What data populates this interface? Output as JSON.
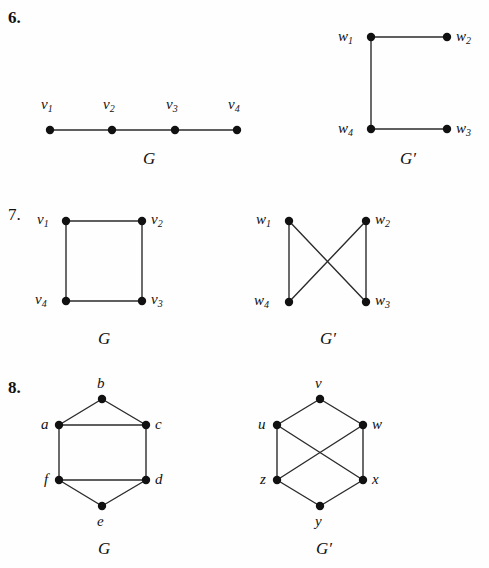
{
  "page": {
    "width": 489,
    "height": 568,
    "background": "#fefefe",
    "ink": "#1a1a1a",
    "kind": "textbook-exercise-figures"
  },
  "problems": [
    {
      "number": "6.",
      "number_style": "bold",
      "graphs": [
        {
          "name": "G",
          "name_x": 143,
          "name_y": 150,
          "vertices": [
            {
              "id": "v1",
              "label": "v",
              "sub": "1",
              "x": 50,
              "y": 130,
              "label_x": 41,
              "label_y": 97
            },
            {
              "id": "v2",
              "label": "v",
              "sub": "2",
              "x": 112,
              "y": 130,
              "label_x": 103,
              "label_y": 97
            },
            {
              "id": "v3",
              "label": "v",
              "sub": "3",
              "x": 175,
              "y": 130,
              "label_x": 166,
              "label_y": 97
            },
            {
              "id": "v4",
              "label": "v",
              "sub": "4",
              "x": 237,
              "y": 130,
              "label_x": 228,
              "label_y": 97
            }
          ],
          "edges": [
            [
              "v1",
              "v2"
            ],
            [
              "v2",
              "v3"
            ],
            [
              "v3",
              "v4"
            ]
          ]
        },
        {
          "name": "G′",
          "name_x": 400,
          "name_y": 150,
          "vertices": [
            {
              "id": "w1",
              "label": "w",
              "sub": "1",
              "x": 371,
              "y": 37,
              "label_x": 338,
              "label_y": 29
            },
            {
              "id": "w2",
              "label": "w",
              "sub": "2",
              "x": 447,
              "y": 37,
              "label_x": 456,
              "label_y": 29
            },
            {
              "id": "w3",
              "label": "w",
              "sub": "3",
              "x": 447,
              "y": 129,
              "label_x": 456,
              "label_y": 121
            },
            {
              "id": "w4",
              "label": "w",
              "sub": "4",
              "x": 371,
              "y": 129,
              "label_x": 338,
              "label_y": 121
            }
          ],
          "edges": [
            [
              "w1",
              "w2"
            ],
            [
              "w1",
              "w4"
            ],
            [
              "w4",
              "w3"
            ]
          ]
        }
      ]
    },
    {
      "number": "7.",
      "number_style": "regular",
      "graphs": [
        {
          "name": "G",
          "name_x": 98,
          "name_y": 330,
          "vertices": [
            {
              "id": "v1",
              "label": "v",
              "sub": "1",
              "x": 66,
              "y": 221,
              "label_x": 37,
              "label_y": 212
            },
            {
              "id": "v2",
              "label": "v",
              "sub": "2",
              "x": 142,
              "y": 221,
              "label_x": 151,
              "label_y": 212
            },
            {
              "id": "v3",
              "label": "v",
              "sub": "3",
              "x": 142,
              "y": 301,
              "label_x": 151,
              "label_y": 292
            },
            {
              "id": "v4",
              "label": "v",
              "sub": "4",
              "x": 66,
              "y": 301,
              "label_x": 35,
              "label_y": 292
            }
          ],
          "edges": [
            [
              "v1",
              "v2"
            ],
            [
              "v2",
              "v3"
            ],
            [
              "v3",
              "v4"
            ],
            [
              "v4",
              "v1"
            ]
          ]
        },
        {
          "name": "G′",
          "name_x": 320,
          "name_y": 330,
          "vertices": [
            {
              "id": "w1",
              "label": "w",
              "sub": "1",
              "x": 289,
              "y": 221,
              "label_x": 256,
              "label_y": 212
            },
            {
              "id": "w2",
              "label": "w",
              "sub": "2",
              "x": 366,
              "y": 221,
              "label_x": 375,
              "label_y": 212
            },
            {
              "id": "w3",
              "label": "w",
              "sub": "3",
              "x": 366,
              "y": 302,
              "label_x": 375,
              "label_y": 293
            },
            {
              "id": "w4",
              "label": "w",
              "sub": "4",
              "x": 289,
              "y": 302,
              "label_x": 254,
              "label_y": 293
            }
          ],
          "edges": [
            [
              "w1",
              "w4"
            ],
            [
              "w2",
              "w3"
            ],
            [
              "w1",
              "w3"
            ],
            [
              "w2",
              "w4"
            ]
          ]
        }
      ]
    },
    {
      "number": "8.",
      "number_style": "bold",
      "graphs": [
        {
          "name": "G",
          "name_x": 98,
          "name_y": 540,
          "vertices": [
            {
              "id": "b",
              "label": "b",
              "sub": "",
              "x": 102,
              "y": 399,
              "label_x": 97,
              "label_y": 376
            },
            {
              "id": "a",
              "label": "a",
              "sub": "",
              "x": 59,
              "y": 425,
              "label_x": 41,
              "label_y": 417
            },
            {
              "id": "c",
              "label": "c",
              "sub": "",
              "x": 146,
              "y": 425,
              "label_x": 155,
              "label_y": 417
            },
            {
              "id": "f",
              "label": "f",
              "sub": "",
              "x": 59,
              "y": 480,
              "label_x": 44,
              "label_y": 472
            },
            {
              "id": "d",
              "label": "d",
              "sub": "",
              "x": 146,
              "y": 480,
              "label_x": 155,
              "label_y": 472
            },
            {
              "id": "e",
              "label": "e",
              "sub": "",
              "x": 102,
              "y": 506,
              "label_x": 97,
              "label_y": 514
            }
          ],
          "edges": [
            [
              "a",
              "b"
            ],
            [
              "b",
              "c"
            ],
            [
              "a",
              "c"
            ],
            [
              "a",
              "f"
            ],
            [
              "c",
              "d"
            ],
            [
              "f",
              "d"
            ],
            [
              "f",
              "e"
            ],
            [
              "e",
              "d"
            ]
          ]
        },
        {
          "name": "G′",
          "name_x": 316,
          "name_y": 540,
          "vertices": [
            {
              "id": "v",
              "label": "v",
              "sub": "",
              "x": 320,
              "y": 399,
              "label_x": 315,
              "label_y": 376
            },
            {
              "id": "u",
              "label": "u",
              "sub": "",
              "x": 277,
              "y": 425,
              "label_x": 258,
              "label_y": 417
            },
            {
              "id": "w",
              "label": "w",
              "sub": "",
              "x": 363,
              "y": 425,
              "label_x": 372,
              "label_y": 417
            },
            {
              "id": "z",
              "label": "z",
              "sub": "",
              "x": 277,
              "y": 480,
              "label_x": 260,
              "label_y": 472
            },
            {
              "id": "x",
              "label": "x",
              "sub": "",
              "x": 363,
              "y": 480,
              "label_x": 372,
              "label_y": 472
            },
            {
              "id": "y",
              "label": "y",
              "sub": "",
              "x": 320,
              "y": 506,
              "label_x": 315,
              "label_y": 514
            }
          ],
          "edges": [
            [
              "u",
              "v"
            ],
            [
              "v",
              "w"
            ],
            [
              "u",
              "z"
            ],
            [
              "w",
              "x"
            ],
            [
              "u",
              "x"
            ],
            [
              "z",
              "w"
            ],
            [
              "z",
              "y"
            ],
            [
              "y",
              "x"
            ]
          ]
        }
      ]
    }
  ],
  "style": {
    "vertex_radius": 4.2,
    "edge_width": 1.4,
    "edge_color": "#2b2b2b",
    "vertex_color": "#111111"
  }
}
